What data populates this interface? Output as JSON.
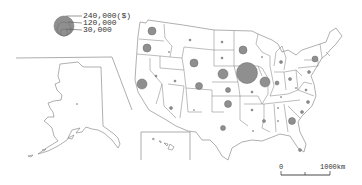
{
  "map": {
    "type": "proportional-symbol",
    "subject": "United States by state",
    "fill_color": "#8f8f8f",
    "outline_color": "#7a7a7a"
  },
  "legend": {
    "items": [
      {
        "value": "240,000($)",
        "r": 10
      },
      {
        "value": "120,000",
        "r": 7
      },
      {
        "value": "30,000",
        "r": 3.5
      }
    ]
  },
  "scale_bar": {
    "start_label": "0",
    "end_label": "1000km"
  },
  "bubbles": [
    {
      "state": "WA",
      "cx": 152,
      "cy": 31,
      "r": 4
    },
    {
      "state": "OR",
      "cx": 147,
      "cy": 48,
      "r": 4
    },
    {
      "state": "CA",
      "cx": 142,
      "cy": 84,
      "r": 5
    },
    {
      "state": "ID",
      "cx": 169,
      "cy": 52,
      "r": 0.6
    },
    {
      "state": "NV",
      "cx": 156,
      "cy": 76,
      "r": 1
    },
    {
      "state": "MT",
      "cx": 190,
      "cy": 40,
      "r": 1
    },
    {
      "state": "WY",
      "cx": 194,
      "cy": 63,
      "r": 4
    },
    {
      "state": "UT",
      "cx": 175,
      "cy": 81,
      "r": 1
    },
    {
      "state": "CO",
      "cx": 199,
      "cy": 86,
      "r": 3.5
    },
    {
      "state": "AZ",
      "cx": 171,
      "cy": 108,
      "r": 1.5
    },
    {
      "state": "NM",
      "cx": 194,
      "cy": 110,
      "r": 0.5
    },
    {
      "state": "ND",
      "cx": 222,
      "cy": 42,
      "r": 1
    },
    {
      "state": "SD",
      "cx": 222,
      "cy": 58,
      "r": 1
    },
    {
      "state": "NE",
      "cx": 223,
      "cy": 74,
      "r": 5
    },
    {
      "state": "KS",
      "cx": 228,
      "cy": 90,
      "r": 2.5
    },
    {
      "state": "OK",
      "cx": 228,
      "cy": 104,
      "r": 3.5
    },
    {
      "state": "TX",
      "cx": 223,
      "cy": 128,
      "r": 2.5
    },
    {
      "state": "MN",
      "cx": 243,
      "cy": 50,
      "r": 4
    },
    {
      "state": "IA",
      "cx": 247,
      "cy": 73,
      "r": 10.5
    },
    {
      "state": "MO",
      "cx": 252,
      "cy": 92,
      "r": 1
    },
    {
      "state": "AR",
      "cx": 252,
      "cy": 110,
      "r": 1
    },
    {
      "state": "LA",
      "cx": 253,
      "cy": 131,
      "r": 0.6
    },
    {
      "state": "WI",
      "cx": 262,
      "cy": 57,
      "r": 0.6
    },
    {
      "state": "IL",
      "cx": 265,
      "cy": 82,
      "r": 5
    },
    {
      "state": "MI",
      "cx": 281,
      "cy": 62,
      "r": 1.5
    },
    {
      "state": "IN",
      "cx": 277,
      "cy": 83,
      "r": 2
    },
    {
      "state": "OH",
      "cx": 290,
      "cy": 79,
      "r": 1.5
    },
    {
      "state": "KY",
      "cx": 281,
      "cy": 97,
      "r": 0.6
    },
    {
      "state": "TN",
      "cx": 278,
      "cy": 108,
      "r": 0.6
    },
    {
      "state": "MS",
      "cx": 264,
      "cy": 121,
      "r": 1.5
    },
    {
      "state": "AL",
      "cx": 278,
      "cy": 121,
      "r": 0.6
    },
    {
      "state": "GA",
      "cx": 292,
      "cy": 121,
      "r": 3.5
    },
    {
      "state": "FL",
      "cx": 300,
      "cy": 150,
      "r": 1.5
    },
    {
      "state": "SC",
      "cx": 302,
      "cy": 112,
      "r": 1.5
    },
    {
      "state": "NC",
      "cx": 308,
      "cy": 102,
      "r": 1.5
    },
    {
      "state": "VA",
      "cx": 306,
      "cy": 90,
      "r": 1
    },
    {
      "state": "WV",
      "cx": 296,
      "cy": 88,
      "r": 0.6
    },
    {
      "state": "PA",
      "cx": 309,
      "cy": 72,
      "r": 1.5
    },
    {
      "state": "NY",
      "cx": 315,
      "cy": 59,
      "r": 3
    },
    {
      "state": "AK",
      "cx": 77,
      "cy": 104,
      "r": 0.5
    }
  ]
}
